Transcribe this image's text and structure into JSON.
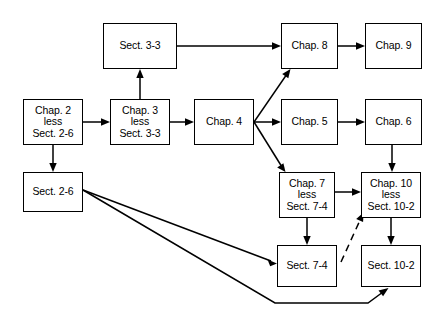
{
  "diagram": {
    "colors": {
      "background": "#ffffff",
      "stroke": "#000000",
      "text": "#000000"
    },
    "nodes": [
      {
        "id": "sect33",
        "lines": [
          "Sect. 3-3"
        ],
        "x": 103,
        "y": 23,
        "w": 74,
        "h": 46
      },
      {
        "id": "chap8",
        "lines": [
          "Chap. 8"
        ],
        "x": 281,
        "y": 23,
        "w": 57,
        "h": 46
      },
      {
        "id": "chap9",
        "lines": [
          "Chap. 9"
        ],
        "x": 365,
        "y": 23,
        "w": 57,
        "h": 46
      },
      {
        "id": "chap2",
        "lines": [
          "Chap. 2",
          "less",
          "Sect. 2-6"
        ],
        "x": 23,
        "y": 99,
        "w": 60,
        "h": 46
      },
      {
        "id": "chap3",
        "lines": [
          "Chap. 3",
          "less",
          "Sect. 3-3"
        ],
        "x": 110,
        "y": 99,
        "w": 60,
        "h": 46
      },
      {
        "id": "chap4",
        "lines": [
          "Chap. 4"
        ],
        "x": 194,
        "y": 99,
        "w": 60,
        "h": 46
      },
      {
        "id": "chap5",
        "lines": [
          "Chap. 5"
        ],
        "x": 281,
        "y": 99,
        "w": 57,
        "h": 46
      },
      {
        "id": "chap6",
        "lines": [
          "Chap. 6"
        ],
        "x": 365,
        "y": 99,
        "w": 57,
        "h": 46
      },
      {
        "id": "sect26",
        "lines": [
          "Sect. 2-6"
        ],
        "x": 23,
        "y": 172,
        "w": 60,
        "h": 40
      },
      {
        "id": "chap7",
        "lines": [
          "Chap. 7",
          "less",
          "Sect. 7-4"
        ],
        "x": 279,
        "y": 172,
        "w": 56,
        "h": 46
      },
      {
        "id": "chap10",
        "lines": [
          "Chap. 10",
          "less",
          "Sect. 10-2"
        ],
        "x": 361,
        "y": 172,
        "w": 60,
        "h": 46
      },
      {
        "id": "sect74",
        "lines": [
          "Sect. 7-4"
        ],
        "x": 277,
        "y": 245,
        "w": 60,
        "h": 42
      },
      {
        "id": "sect102",
        "lines": [
          "Sect. 10-2"
        ],
        "x": 361,
        "y": 245,
        "w": 60,
        "h": 42
      }
    ],
    "edges": [
      {
        "id": "chap2-to-chap3",
        "from": "chap2",
        "to": "chap3",
        "style": "solid"
      },
      {
        "id": "chap3-to-sect33",
        "from": "chap3",
        "to": "sect33",
        "style": "solid"
      },
      {
        "id": "chap3-to-chap4",
        "from": "chap3",
        "to": "chap4",
        "style": "solid"
      },
      {
        "id": "sect33-to-chap8",
        "from": "sect33",
        "to": "chap8",
        "style": "solid"
      },
      {
        "id": "chap8-to-chap9",
        "from": "chap8",
        "to": "chap9",
        "style": "solid"
      },
      {
        "id": "chap4-to-chap8",
        "from": "chap4",
        "to": "chap8",
        "style": "solid"
      },
      {
        "id": "chap4-to-chap5",
        "from": "chap4",
        "to": "chap5",
        "style": "solid"
      },
      {
        "id": "chap4-to-chap7",
        "from": "chap4",
        "to": "chap7",
        "style": "solid"
      },
      {
        "id": "chap5-to-chap6",
        "from": "chap5",
        "to": "chap6",
        "style": "solid"
      },
      {
        "id": "chap6-to-chap10",
        "from": "chap6",
        "to": "chap10",
        "style": "solid"
      },
      {
        "id": "chap2-to-sect26",
        "from": "chap2",
        "to": "sect26",
        "style": "solid"
      },
      {
        "id": "chap7-to-chap10",
        "from": "chap7",
        "to": "chap10",
        "style": "solid"
      },
      {
        "id": "chap7-to-sect74",
        "from": "chap7",
        "to": "sect74",
        "style": "solid"
      },
      {
        "id": "chap10-to-sect102",
        "from": "chap10",
        "to": "sect102",
        "style": "solid"
      },
      {
        "id": "sect26-to-sect74",
        "from": "sect26",
        "to": "sect74",
        "style": "solid"
      },
      {
        "id": "sect26-to-sect102",
        "from": "sect26",
        "to": "sect102",
        "style": "solid"
      },
      {
        "id": "sect74-to-chap10",
        "from": "sect74",
        "to": "chap10",
        "style": "dashed"
      }
    ]
  }
}
